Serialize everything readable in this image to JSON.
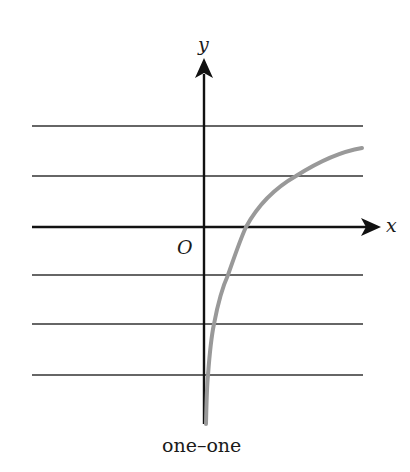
{
  "diagram": {
    "caption": "one–one",
    "axes": {
      "x_label": "x",
      "y_label": "y",
      "origin_label": "O"
    },
    "curve": {
      "type": "logarithmic",
      "description": "increasing curve, vertical asymptote at y-axis, crosses each horizontal line exactly once",
      "color": "#999999"
    },
    "horizontal_lines": {
      "count": 5,
      "color": "#666666",
      "description": "horizontal line test lines"
    },
    "colors": {
      "axis": "#111111",
      "grid_line": "#666666",
      "curve": "#999999",
      "background": "#ffffff"
    }
  }
}
